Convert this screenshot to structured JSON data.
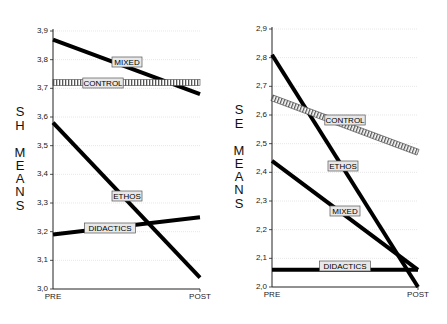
{
  "chart_data": [
    {
      "type": "line",
      "title": "",
      "ylabel": "SH MEANS",
      "xlabel": "",
      "categories": [
        "PRE",
        "POST"
      ],
      "ylim": [
        3.0,
        3.9
      ],
      "yticks": [
        "3,0",
        "3,1",
        "3,2",
        "3,3",
        "3,4",
        "3,5",
        "3,6",
        "3,7",
        "3,8",
        "3,9"
      ],
      "grid": true,
      "series": [
        {
          "name": "MIXED",
          "values": [
            3.87,
            3.68
          ],
          "style": "solid"
        },
        {
          "name": "CONTROL",
          "values": [
            3.72,
            3.72
          ],
          "style": "hatched"
        },
        {
          "name": "ETHOS",
          "values": [
            3.58,
            3.04
          ],
          "style": "solid"
        },
        {
          "name": "DIDACTICS",
          "values": [
            3.19,
            3.25
          ],
          "style": "solid"
        }
      ]
    },
    {
      "type": "line",
      "title": "",
      "ylabel": "SE MEANS",
      "xlabel": "",
      "categories": [
        "PRE",
        "POST"
      ],
      "ylim": [
        2.0,
        2.9
      ],
      "yticks": [
        "2,0",
        "2,1",
        "2,2",
        "2,3",
        "2,4",
        "2,5",
        "2,6",
        "2,7",
        "2,8",
        "2,9"
      ],
      "grid": true,
      "series": [
        {
          "name": "ETHOS",
          "values": [
            2.81,
            2.0
          ],
          "style": "solid"
        },
        {
          "name": "CONTROL",
          "values": [
            2.66,
            2.47
          ],
          "style": "hatched"
        },
        {
          "name": "MIXED",
          "values": [
            2.44,
            2.06
          ],
          "style": "solid"
        },
        {
          "name": "DIDACTICS",
          "values": [
            2.06,
            2.06
          ],
          "style": "solid"
        }
      ]
    }
  ],
  "left": {
    "ylabel_letters": [
      "S",
      "H",
      "M",
      "E",
      "A",
      "N",
      "S"
    ],
    "labels": {
      "mixed": "MIXED",
      "control": "CONTROL",
      "ethos": "ETHOS",
      "didactics": "DIDACTICS"
    },
    "x": {
      "pre": "PRE",
      "post": "POST"
    }
  },
  "right": {
    "ylabel_letters": [
      "S",
      "E",
      "M",
      "E",
      "A",
      "N",
      "S"
    ],
    "labels": {
      "ethos": "ETHOS",
      "control": "CONTROL",
      "mixed": "MIXED",
      "didactics": "DIDACTICS"
    },
    "x": {
      "pre": "PRE",
      "post": "POST"
    }
  }
}
